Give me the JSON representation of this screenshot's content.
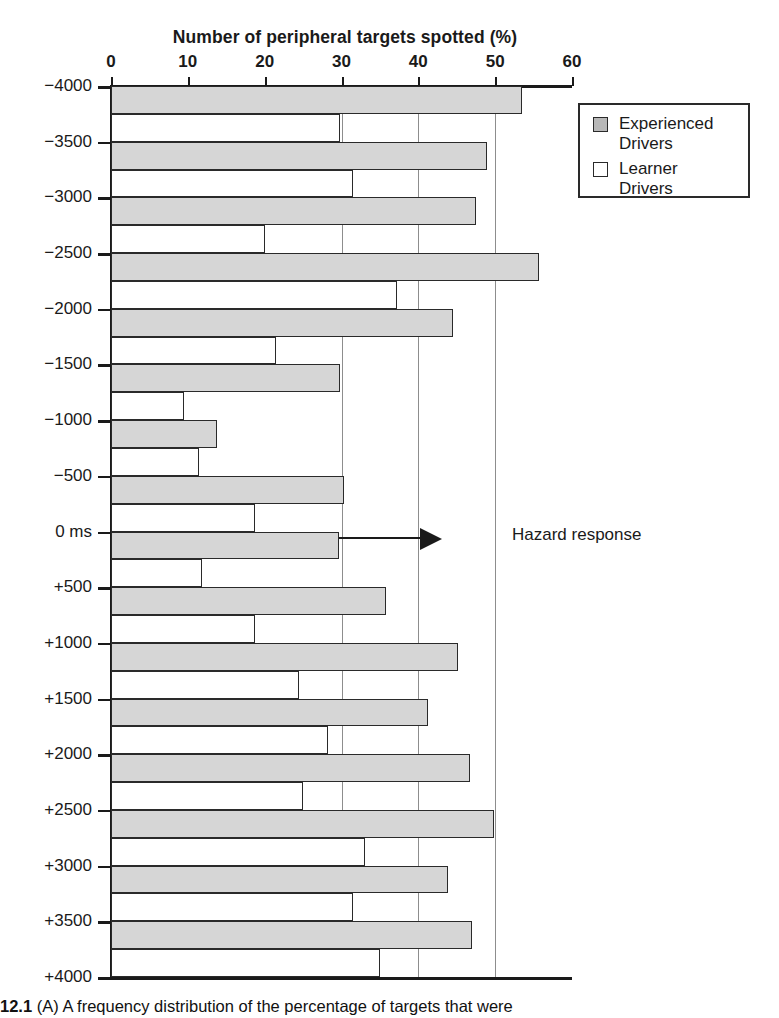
{
  "chart_data": {
    "type": "bar",
    "orientation": "horizontal-grouped",
    "title": "Number of peripheral targets spotted (%)",
    "xlabel": "Number of peripheral targets spotted (%)",
    "ylabel": "",
    "xlim": [
      0,
      60
    ],
    "xticks": [
      0,
      10,
      20,
      30,
      40,
      50,
      60
    ],
    "xtick_labels": [
      "0",
      "10",
      "20",
      "30",
      "40",
      "50",
      "60"
    ],
    "ylim": [
      -4000,
      4000
    ],
    "yticks": [
      -4000,
      -3500,
      -3000,
      -2500,
      -2000,
      -1500,
      -1000,
      -500,
      0,
      500,
      1000,
      1500,
      2000,
      2500,
      3000,
      3500,
      4000
    ],
    "ytick_labels": [
      "−4000",
      "−3500",
      "−3000",
      "−2500",
      "−2000",
      "−1500",
      "−1000",
      "−500",
      "0 ms",
      "+500",
      "+1000",
      "+1500",
      "+2000",
      "+2500",
      "+3000",
      "+3500",
      "+4000"
    ],
    "grid": true,
    "gridlines_x": [
      30,
      40,
      50
    ],
    "legend_position": "top-right",
    "categories": [
      "−4000",
      "−3500",
      "−3000",
      "−2500",
      "−2000",
      "−1500",
      "−1000",
      "−500",
      "0 ms",
      "+500",
      "+1000",
      "+1500",
      "+2000",
      "+2500",
      "+3000",
      "+3500"
    ],
    "series": [
      {
        "name": "Experienced Drivers",
        "color": "#d6d6d6",
        "values": [
          53.5,
          49.0,
          47.5,
          55.7,
          44.5,
          29.8,
          13.8,
          30.3,
          29.7,
          35.8,
          45.2,
          41.2,
          46.7,
          49.8,
          43.8,
          47.0
        ]
      },
      {
        "name": "Learner Drivers",
        "color": "#ffffff",
        "values": [
          29.8,
          31.5,
          20.0,
          37.2,
          21.5,
          9.5,
          11.5,
          18.7,
          11.8,
          18.8,
          24.5,
          28.2,
          25.0,
          33.0,
          31.5,
          35.0
        ]
      }
    ],
    "annotations": [
      {
        "text": "Hazard response",
        "points_to_y": "0 ms",
        "arrow": "right"
      }
    ]
  },
  "chart": {
    "title": "Number of peripheral targets spotted (%)"
  },
  "legend": {
    "items": [
      {
        "label_line1": "Experienced",
        "label_line2": "Drivers",
        "swatch": "gray-swatch"
      },
      {
        "label_line1": "Learner",
        "label_line2": "Drivers",
        "swatch": "white-swatch"
      }
    ]
  },
  "annotation": {
    "hazard_label": "Hazard response"
  },
  "caption": {
    "figure_number": "12.1",
    "text": "(A) A frequency distribution of the percentage of targets that were"
  }
}
